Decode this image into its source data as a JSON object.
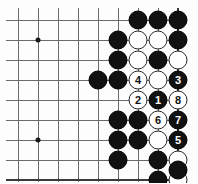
{
  "diagram": {
    "type": "go-board-problem",
    "board_region": "bottom-right corner of a go board, right and bottom edges shown",
    "grid": {
      "spacing_px": 20,
      "origin_x": 18,
      "origin_y": 20,
      "cols": 9,
      "rows": 9,
      "right_edge_col": 8,
      "bottom_edge_row": 8,
      "line_color": "#6b6b6b",
      "edge_color": "#3a3a3a",
      "background": "#fdfdfd"
    },
    "star_points": [
      {
        "col": 1,
        "row": 1
      },
      {
        "col": 1,
        "row": 6
      }
    ],
    "colors": {
      "black_stone": "#111111",
      "white_stone": "#ffffff",
      "black_label": "#ffffff",
      "white_label": "#111111"
    },
    "stones": [
      {
        "col": 6,
        "row": 0,
        "color": "black",
        "label": ""
      },
      {
        "col": 7,
        "row": 0,
        "color": "black",
        "label": ""
      },
      {
        "col": 8,
        "row": 0,
        "color": "black",
        "label": ""
      },
      {
        "col": 5,
        "row": 1,
        "color": "black",
        "label": ""
      },
      {
        "col": 6,
        "row": 1,
        "color": "white",
        "label": ""
      },
      {
        "col": 7,
        "row": 1,
        "color": "white",
        "label": ""
      },
      {
        "col": 8,
        "row": 1,
        "color": "black",
        "label": ""
      },
      {
        "col": 5,
        "row": 2,
        "color": "black",
        "label": ""
      },
      {
        "col": 6,
        "row": 2,
        "color": "white",
        "label": ""
      },
      {
        "col": 7,
        "row": 2,
        "color": "black",
        "label": ""
      },
      {
        "col": 8,
        "row": 2,
        "color": "white",
        "label": ""
      },
      {
        "col": 5,
        "row": 3,
        "color": "black",
        "label": ""
      },
      {
        "col": 6,
        "row": 3,
        "color": "white",
        "label": "4"
      },
      {
        "col": 7,
        "row": 3,
        "color": "white",
        "label": ""
      },
      {
        "col": 8,
        "row": 3,
        "color": "black",
        "label": "3"
      },
      {
        "col": 6,
        "row": 4,
        "color": "white",
        "label": "2"
      },
      {
        "col": 7,
        "row": 4,
        "color": "black",
        "label": "1"
      },
      {
        "col": 8,
        "row": 4,
        "color": "white",
        "label": "8"
      },
      {
        "col": 6,
        "row": 5,
        "color": "black",
        "label": ""
      },
      {
        "col": 7,
        "row": 5,
        "color": "white",
        "label": "6"
      },
      {
        "col": 8,
        "row": 5,
        "color": "black",
        "label": "7"
      },
      {
        "col": 6,
        "row": 6,
        "color": "black",
        "label": ""
      },
      {
        "col": 7,
        "row": 6,
        "color": "white",
        "label": ""
      },
      {
        "col": 8,
        "row": 6,
        "color": "black",
        "label": "5"
      },
      {
        "col": 5,
        "row": 7,
        "color": "black",
        "label": ""
      },
      {
        "col": 7,
        "row": 7,
        "color": "black",
        "label": ""
      },
      {
        "col": 8,
        "row": 7,
        "color": "white",
        "label": ""
      },
      {
        "col": 7,
        "row": 8,
        "color": "black",
        "label": ""
      },
      {
        "col": 8,
        "row": 8,
        "color": "white",
        "label": ""
      }
    ],
    "extra_stones": [
      {
        "x": 98,
        "y": 80,
        "color": "black",
        "label": ""
      },
      {
        "x": 118,
        "y": 140,
        "color": "black",
        "label": ""
      },
      {
        "x": 118,
        "y": 120,
        "color": "black",
        "label": ""
      },
      {
        "x": 178,
        "y": 170,
        "color": "black",
        "label": ""
      }
    ],
    "move_sequence": [
      {
        "number": "1",
        "color": "black"
      },
      {
        "number": "2",
        "color": "white"
      },
      {
        "number": "3",
        "color": "black"
      },
      {
        "number": "4",
        "color": "white"
      },
      {
        "number": "5",
        "color": "black"
      },
      {
        "number": "6",
        "color": "white"
      },
      {
        "number": "7",
        "color": "black"
      },
      {
        "number": "8",
        "color": "white"
      }
    ]
  }
}
